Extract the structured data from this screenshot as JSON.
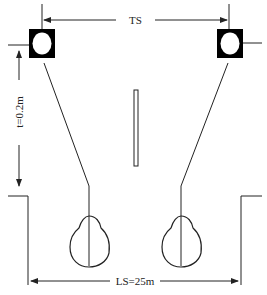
{
  "diagram": {
    "labels": {
      "top_dimension": "TS",
      "side_dimension": "t=0.2m",
      "bottom_dimension": "LS=25m"
    },
    "elements": {
      "left_speaker": "speaker-icon",
      "right_speaker": "speaker-icon",
      "center_divider": "divider-bar",
      "left_listener_head": "head-outline",
      "right_listener_head": "head-outline"
    },
    "colors": {
      "stroke": "#222222",
      "fill_speaker": "#000000",
      "background": "#ffffff"
    }
  }
}
